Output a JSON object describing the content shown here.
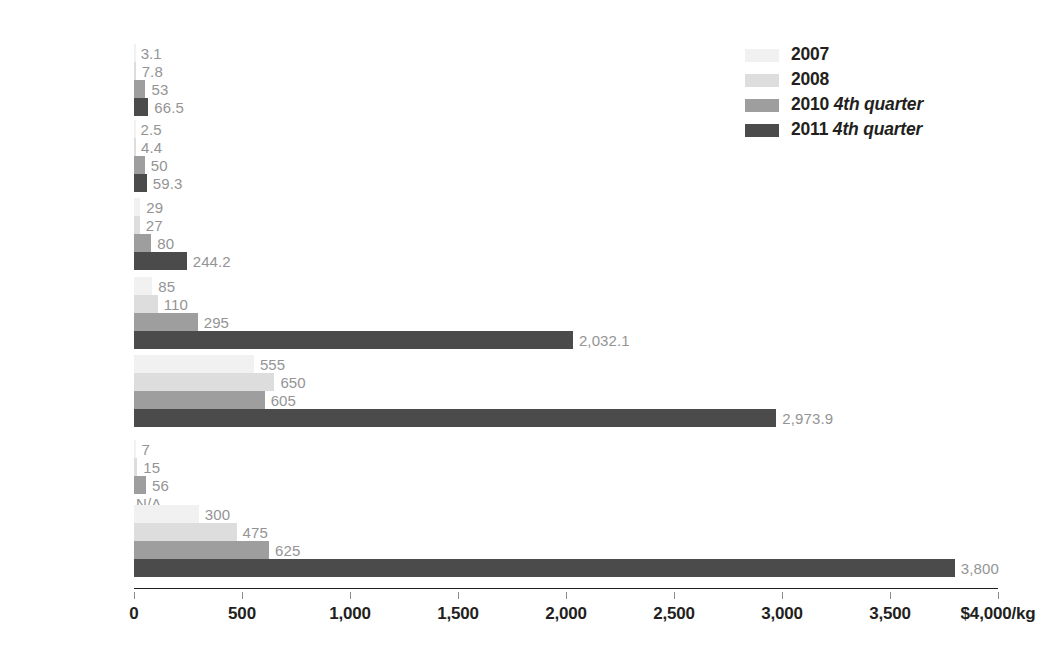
{
  "chart_data": {
    "type": "bar",
    "orientation": "horizontal",
    "title": "",
    "xlabel": "",
    "ylabel": "",
    "xlim": [
      0,
      4000
    ],
    "xticks": [
      0,
      500,
      1000,
      1500,
      2000,
      2500,
      3000,
      3500,
      4000
    ],
    "xtick_labels": [
      "0",
      "500",
      "1,000",
      "1,500",
      "2,000",
      "2,500",
      "3,000",
      "3,500",
      "$4,000/kg"
    ],
    "grid": false,
    "legend_position": "top-right",
    "categories": [
      "Lanthanum",
      "Cerium",
      "Neodymium",
      "Dysprosium",
      "Terbium",
      "Yttrium",
      "Europium"
    ],
    "series": [
      {
        "name": "2007",
        "color": "#f1f1f1",
        "values": [
          3.1,
          2.5,
          29,
          85,
          555,
          7,
          300
        ],
        "labels": [
          "3.1",
          "2.5",
          "29",
          "85",
          "555",
          "7",
          "300"
        ]
      },
      {
        "name": "2008",
        "color": "#dddddd",
        "values": [
          7.8,
          4.4,
          27,
          110,
          650,
          15,
          475
        ],
        "labels": [
          "7.8",
          "4.4",
          "27",
          "110",
          "650",
          "15",
          "475"
        ]
      },
      {
        "name": "2010 4th quarter",
        "name_prefix": "2010",
        "name_suffix": "4th quarter",
        "color": "#9e9e9e",
        "values": [
          53,
          50,
          80,
          295,
          605,
          56,
          625
        ],
        "labels": [
          "53",
          "50",
          "80",
          "295",
          "605",
          "56",
          "625"
        ]
      },
      {
        "name": "2011 4th quarter",
        "name_prefix": "2011",
        "name_suffix": "4th quarter",
        "color": "#4b4b4b",
        "values": [
          66.5,
          59.3,
          244.2,
          2032.1,
          2973.9,
          null,
          3800
        ],
        "labels": [
          "66.5",
          "59.3",
          "244.2",
          "2,032.1",
          "2,973.9",
          "N/A",
          "3,800"
        ]
      }
    ]
  },
  "legend": {
    "items": [
      {
        "label_prefix": "2007",
        "label_suffix": "",
        "color": "#f1f1f1"
      },
      {
        "label_prefix": "2008",
        "label_suffix": "",
        "color": "#dddddd"
      },
      {
        "label_prefix": "2010",
        "label_suffix": "4th quarter",
        "color": "#9e9e9e"
      },
      {
        "label_prefix": "2011",
        "label_suffix": "4th quarter",
        "color": "#4b4b4b"
      }
    ]
  },
  "axis": {
    "unit_label": "$4,000/kg"
  }
}
